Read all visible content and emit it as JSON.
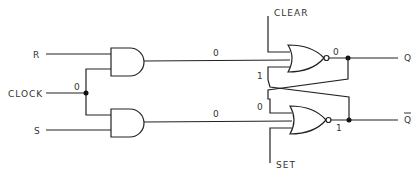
{
  "diagram": {
    "inputs": {
      "r": "R",
      "clock": "CLOCK",
      "s": "S",
      "clear": "CLEAR",
      "set": "SET"
    },
    "outputs": {
      "q": "Q",
      "q_bar": "Q"
    },
    "values": {
      "clock_node": "0",
      "and_top_out": "0",
      "and_bottom_out": "0",
      "nor_top_feedback_in": "1",
      "nor_top_out": "0",
      "nor_bottom_feedback_in": "0",
      "nor_bottom_out": "1"
    },
    "gates": [
      {
        "type": "AND",
        "name": "and-gate-top"
      },
      {
        "type": "AND",
        "name": "and-gate-bottom"
      },
      {
        "type": "NOR",
        "name": "nor-gate-top"
      },
      {
        "type": "NOR",
        "name": "nor-gate-bottom"
      }
    ]
  }
}
